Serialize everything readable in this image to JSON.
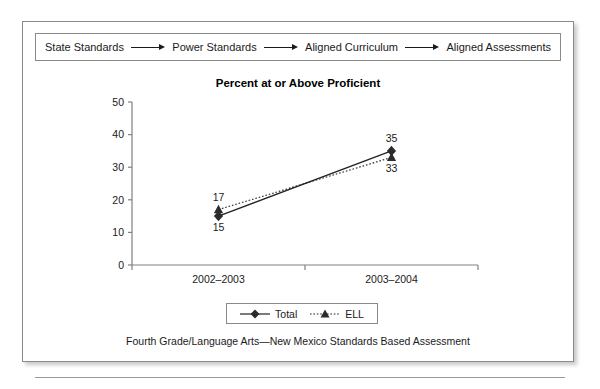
{
  "flow": {
    "name": "standards-alignment-flow",
    "steps": [
      "State Standards",
      "Power Standards",
      "Aligned Curriculum",
      "Aligned Assessments"
    ],
    "arrow_icon": "right-arrow-icon"
  },
  "caption": "Fourth Grade/Language Arts—New Mexico Standards Based Assessment",
  "colors": {
    "line": "#222222",
    "axis": "#808080",
    "frame": "#8a8a8a",
    "text": "#1a1a1a"
  },
  "chart_data": {
    "type": "line",
    "title": "Percent at or Above Proficient",
    "xlabel": "",
    "ylabel": "",
    "categories": [
      "2002–2003",
      "2003–2004"
    ],
    "ylim": [
      0,
      50
    ],
    "yticks": [
      0,
      10,
      20,
      30,
      40,
      50
    ],
    "ytick_labels": [
      "0",
      "10",
      "20",
      "30",
      "40",
      "50"
    ],
    "grid": false,
    "legend_position": "bottom",
    "series": [
      {
        "name": "Total",
        "values": [
          15,
          35
        ],
        "marker": "diamond",
        "linestyle": "solid",
        "data_labels": [
          "15",
          "35"
        ],
        "label_positions": [
          "below",
          "above"
        ]
      },
      {
        "name": "ELL",
        "values": [
          17,
          33
        ],
        "marker": "triangle",
        "linestyle": "dotted",
        "data_labels": [
          "17",
          "33"
        ],
        "label_positions": [
          "above",
          "below"
        ]
      }
    ]
  }
}
